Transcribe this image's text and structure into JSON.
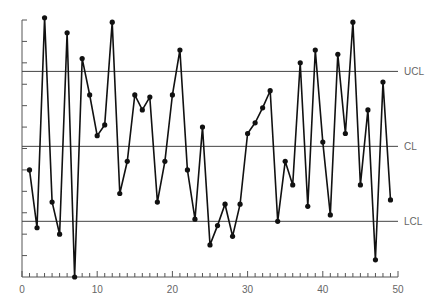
{
  "chart_data": {
    "type": "line",
    "title": "",
    "xlabel": "",
    "ylabel": "",
    "xlim": [
      0,
      50
    ],
    "ylim": [
      0,
      12
    ],
    "x_ticks_major": [
      0,
      10,
      20,
      30,
      40,
      50
    ],
    "x_tick_labels": [
      "0",
      "10",
      "20",
      "30",
      "40",
      "50"
    ],
    "x_minor_tick_step": 1,
    "y_tick_count": 12,
    "y_tick_labels": [],
    "grid": false,
    "legend": null,
    "control_lines": [
      {
        "name": "UCL",
        "label": "UCL",
        "value": 9.6
      },
      {
        "name": "CL",
        "label": "CL",
        "value": 6.1
      },
      {
        "name": "LCL",
        "label": "LCL",
        "value": 2.6
      }
    ],
    "series": [
      {
        "name": "measurement",
        "x": [
          1,
          2,
          3,
          4,
          5,
          6,
          7,
          8,
          9,
          10,
          11,
          12,
          13,
          14,
          15,
          16,
          17,
          18,
          19,
          20,
          21,
          22,
          23,
          24,
          25,
          26,
          27,
          28,
          29,
          30,
          31,
          32,
          33,
          34,
          35,
          36,
          37,
          38,
          39,
          40,
          41,
          42,
          43,
          44,
          45,
          46,
          47,
          48,
          49
        ],
        "values": [
          5.0,
          2.3,
          12.1,
          3.5,
          2.0,
          11.4,
          0.0,
          10.2,
          8.5,
          6.6,
          7.1,
          11.9,
          3.9,
          5.4,
          8.5,
          7.8,
          8.4,
          3.5,
          5.4,
          8.5,
          10.6,
          5.0,
          2.7,
          7.0,
          1.5,
          2.4,
          3.4,
          1.9,
          3.4,
          6.7,
          7.2,
          7.9,
          8.7,
          2.6,
          5.4,
          4.3,
          10.0,
          3.3,
          10.6,
          6.3,
          2.9,
          10.4,
          6.7,
          11.9,
          4.3,
          7.8,
          0.8,
          9.1,
          3.6
        ]
      }
    ]
  },
  "labels": {
    "ucl": "UCL",
    "cl": "CL",
    "lcl": "LCL"
  },
  "colors": {
    "series": "#111111",
    "control_line": "#444444",
    "axis": "#555555",
    "label": "#666666"
  }
}
